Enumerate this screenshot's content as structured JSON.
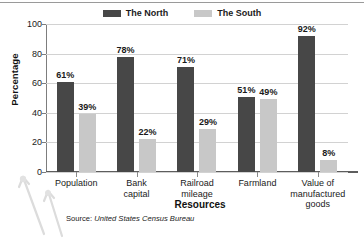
{
  "chart_data": {
    "type": "bar",
    "title": "",
    "xlabel": "Resources",
    "ylabel": "Percentage",
    "ylim": [
      0,
      100
    ],
    "yticks": [
      "0",
      "20",
      "40",
      "60",
      "80",
      "100"
    ],
    "grid": true,
    "legend_position": "top-center",
    "value_suffix": "%",
    "categories": [
      "Population",
      "Bank capital",
      "Railroad mileage",
      "Farmland",
      "Value of manufactured goods"
    ],
    "category_lines": [
      [
        "Population"
      ],
      [
        "Bank",
        "capital"
      ],
      [
        "Railroad",
        "mileage"
      ],
      [
        "Farmland"
      ],
      [
        "Value of",
        "manufactured",
        "goods"
      ]
    ],
    "series": [
      {
        "name": "The North",
        "color": "#474747",
        "values": [
          61,
          78,
          71,
          51,
          92
        ],
        "labels": [
          "61%",
          "78%",
          "71%",
          "51%",
          "92%"
        ]
      },
      {
        "name": "The South",
        "color": "#c8c8c8",
        "values": [
          39,
          22,
          29,
          49,
          8
        ],
        "labels": [
          "39%",
          "22%",
          "29%",
          "49%",
          "8%"
        ]
      }
    ],
    "source": {
      "label": "Source:",
      "value": "United States Census Bureau"
    }
  },
  "legend": {
    "entries": [
      {
        "label": "The North",
        "color": "#474747"
      },
      {
        "label": "The South",
        "color": "#c8c8c8"
      }
    ]
  }
}
